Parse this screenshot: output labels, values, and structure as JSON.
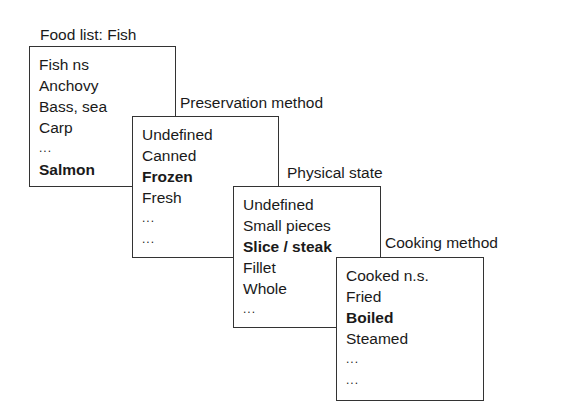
{
  "panels": [
    {
      "title": "Food list: Fish",
      "items": [
        {
          "text": "Fish ns",
          "bold": false
        },
        {
          "text": "Anchovy",
          "bold": false
        },
        {
          "text": "Bass, sea",
          "bold": false
        },
        {
          "text": "Carp",
          "bold": false
        },
        {
          "text": "...",
          "bold": false
        },
        {
          "text": "Salmon",
          "bold": true
        }
      ]
    },
    {
      "title": "Preservation method",
      "items": [
        {
          "text": "Undefined",
          "bold": false
        },
        {
          "text": "Canned",
          "bold": false
        },
        {
          "text": "Frozen",
          "bold": true
        },
        {
          "text": "Fresh",
          "bold": false
        },
        {
          "text": "...",
          "bold": false
        },
        {
          "text": "...",
          "bold": false
        }
      ]
    },
    {
      "title": "Physical state",
      "items": [
        {
          "text": "Undefined",
          "bold": false
        },
        {
          "text": "Small pieces",
          "bold": false
        },
        {
          "text": "Slice / steak",
          "bold": true
        },
        {
          "text": "Fillet",
          "bold": false
        },
        {
          "text": "Whole",
          "bold": false
        },
        {
          "text": "...",
          "bold": false
        }
      ]
    },
    {
      "title": "Cooking method",
      "items": [
        {
          "text": "Cooked n.s.",
          "bold": false
        },
        {
          "text": "Fried",
          "bold": false
        },
        {
          "text": "Boiled",
          "bold": true
        },
        {
          "text": "Steamed",
          "bold": false
        },
        {
          "text": "...",
          "bold": false
        },
        {
          "text": "...",
          "bold": false
        }
      ]
    }
  ]
}
